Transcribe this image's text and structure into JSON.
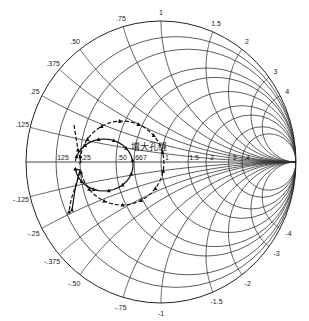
{
  "chart_data": {
    "type": "smith-chart",
    "title": "",
    "annotation": "增大孔缝",
    "real_axis_labels": [
      ".125",
      ".25",
      ".50",
      ".667",
      "1",
      "1.5",
      "2",
      "3",
      "4"
    ],
    "resistance_circles": [
      0.125,
      0.25,
      0.5,
      0.667,
      1,
      1.5,
      2,
      3,
      4
    ],
    "reactance_labels_top": [
      ".125",
      ".25",
      ".375",
      ".50",
      ".75",
      "1",
      "1.5",
      "2",
      "3",
      "4"
    ],
    "reactance_labels_bottom": [
      "-.125",
      "-.25",
      "-.375",
      "-.50",
      "-.75",
      "-1",
      "-1.5",
      "-2",
      "-3",
      "-4"
    ],
    "reactance_arcs": [
      0.125,
      0.25,
      0.375,
      0.5,
      0.75,
      1,
      1.5,
      2,
      3,
      4
    ],
    "series": [
      {
        "name": "solid curve",
        "style": "solid",
        "marker": "triangle"
      },
      {
        "name": "dashed curve",
        "style": "dashed",
        "marker": "triangle"
      }
    ]
  },
  "annotation_text": "增大孔缝"
}
